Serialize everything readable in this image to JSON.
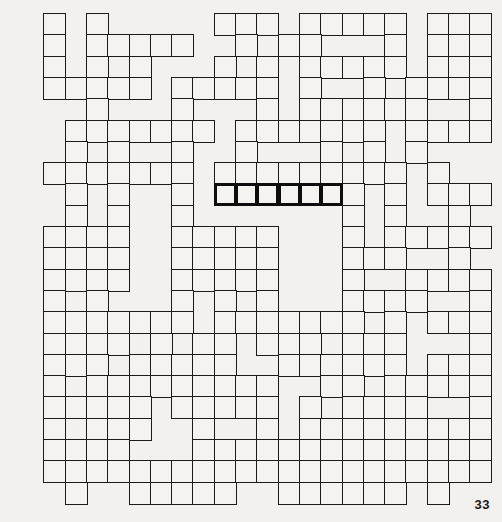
{
  "page": {
    "number": "33",
    "background_color": "#f2f1ee",
    "line_color": "#1b1b1b",
    "highlight_color": "#0d0d0d"
  },
  "puzzle": {
    "type": "crossword-grid-pattern",
    "columns": 22,
    "rows": 23,
    "cell_size": 21.3,
    "origin_x": 22,
    "origin_y": 13,
    "highlight": {
      "row": 8,
      "col_start": 9,
      "col_end": 14
    },
    "cells": [
      [
        0,
        1,
        0,
        1,
        0,
        0,
        0,
        0,
        0,
        1,
        1,
        1,
        0,
        1,
        1,
        1,
        1,
        1,
        0,
        1,
        1,
        1
      ],
      [
        0,
        1,
        0,
        1,
        1,
        1,
        1,
        1,
        0,
        0,
        1,
        0,
        1,
        1,
        0,
        0,
        0,
        1,
        0,
        1,
        1,
        1
      ],
      [
        0,
        1,
        0,
        1,
        0,
        1,
        0,
        0,
        0,
        1,
        0,
        1,
        0,
        1,
        1,
        1,
        1,
        1,
        0,
        1,
        1,
        1
      ],
      [
        0,
        1,
        1,
        1,
        1,
        1,
        0,
        1,
        1,
        1,
        1,
        1,
        0,
        1,
        0,
        0,
        1,
        0,
        1,
        1,
        1,
        1
      ],
      [
        0,
        0,
        0,
        1,
        0,
        0,
        0,
        1,
        0,
        0,
        0,
        1,
        0,
        1,
        1,
        1,
        1,
        1,
        1,
        0,
        0,
        1
      ],
      [
        0,
        0,
        1,
        1,
        1,
        1,
        1,
        1,
        1,
        0,
        1,
        1,
        1,
        1,
        1,
        1,
        1,
        0,
        1,
        1,
        1,
        1
      ],
      [
        0,
        0,
        1,
        0,
        1,
        0,
        0,
        1,
        0,
        0,
        1,
        0,
        0,
        0,
        1,
        0,
        1,
        0,
        1,
        0,
        0,
        0
      ],
      [
        0,
        1,
        1,
        1,
        1,
        1,
        1,
        1,
        0,
        1,
        1,
        1,
        1,
        1,
        1,
        1,
        1,
        1,
        0,
        1,
        0,
        0
      ],
      [
        0,
        0,
        1,
        0,
        1,
        0,
        0,
        1,
        0,
        1,
        1,
        1,
        1,
        1,
        1,
        1,
        0,
        1,
        0,
        1,
        1,
        1
      ],
      [
        0,
        0,
        1,
        0,
        1,
        0,
        0,
        1,
        0,
        0,
        0,
        0,
        0,
        0,
        0,
        1,
        0,
        1,
        0,
        0,
        1,
        0
      ],
      [
        0,
        1,
        1,
        1,
        1,
        0,
        0,
        1,
        1,
        1,
        1,
        1,
        0,
        0,
        0,
        1,
        0,
        1,
        1,
        1,
        1,
        1
      ],
      [
        0,
        1,
        1,
        1,
        1,
        0,
        0,
        1,
        1,
        1,
        1,
        1,
        0,
        0,
        0,
        1,
        1,
        1,
        0,
        0,
        1,
        0
      ],
      [
        0,
        1,
        1,
        1,
        1,
        0,
        0,
        1,
        1,
        1,
        1,
        1,
        0,
        0,
        0,
        1,
        0,
        0,
        1,
        1,
        1,
        1
      ],
      [
        0,
        1,
        0,
        1,
        0,
        0,
        0,
        1,
        0,
        1,
        0,
        1,
        0,
        0,
        0,
        1,
        1,
        1,
        1,
        0,
        0,
        1
      ],
      [
        0,
        1,
        1,
        1,
        1,
        1,
        1,
        1,
        0,
        1,
        1,
        1,
        1,
        1,
        1,
        1,
        0,
        1,
        0,
        1,
        1,
        1
      ],
      [
        0,
        1,
        1,
        1,
        1,
        0,
        1,
        0,
        1,
        1,
        0,
        1,
        1,
        1,
        0,
        1,
        1,
        1,
        0,
        0,
        0,
        1
      ],
      [
        0,
        1,
        1,
        1,
        0,
        1,
        1,
        1,
        1,
        1,
        0,
        0,
        1,
        1,
        1,
        1,
        1,
        1,
        0,
        1,
        1,
        1
      ],
      [
        0,
        1,
        0,
        1,
        1,
        1,
        1,
        1,
        1,
        1,
        1,
        1,
        0,
        0,
        1,
        1,
        0,
        1,
        1,
        1,
        1,
        1
      ],
      [
        0,
        1,
        1,
        1,
        1,
        1,
        0,
        1,
        1,
        1,
        1,
        1,
        0,
        1,
        0,
        1,
        1,
        1,
        1,
        0,
        0,
        1
      ],
      [
        0,
        1,
        0,
        1,
        1,
        1,
        0,
        0,
        1,
        0,
        0,
        1,
        0,
        1,
        1,
        1,
        1,
        1,
        1,
        1,
        1,
        1
      ],
      [
        0,
        1,
        1,
        1,
        1,
        0,
        0,
        0,
        1,
        1,
        1,
        1,
        1,
        1,
        1,
        1,
        1,
        1,
        1,
        1,
        1,
        1
      ],
      [
        0,
        1,
        1,
        1,
        1,
        1,
        1,
        1,
        1,
        1,
        1,
        1,
        1,
        1,
        1,
        1,
        1,
        1,
        1,
        1,
        1,
        1
      ],
      [
        0,
        0,
        1,
        0,
        0,
        1,
        1,
        1,
        1,
        1,
        0,
        0,
        1,
        1,
        1,
        1,
        1,
        1,
        0,
        1,
        0,
        0
      ]
    ]
  }
}
